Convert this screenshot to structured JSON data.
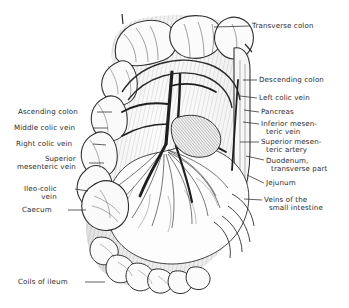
{
  "figure": {
    "style": "pen-and-ink engraving",
    "background_color": "#ffffff",
    "ink_color": "#2b2b2b"
  },
  "labels_right": [
    {
      "id": "transverse-colon",
      "lines": [
        "Transverse colon"
      ],
      "x": 252,
      "y": 22,
      "leader": {
        "x1": 250,
        "y1": 26,
        "x2": 214,
        "y2": 27
      }
    },
    {
      "id": "descending-colon",
      "lines": [
        "Descending colon"
      ],
      "x": 259,
      "y": 76,
      "leader": {
        "x1": 257,
        "y1": 80,
        "x2": 243,
        "y2": 80
      }
    },
    {
      "id": "left-colic-vein",
      "lines": [
        "Left colic vein"
      ],
      "x": 259,
      "y": 94,
      "leader": {
        "x1": 257,
        "y1": 98,
        "x2": 240,
        "y2": 96
      }
    },
    {
      "id": "pancreas",
      "lines": [
        "Pancreas"
      ],
      "x": 261,
      "y": 108,
      "leader": {
        "x1": 259,
        "y1": 112,
        "x2": 244,
        "y2": 110
      }
    },
    {
      "id": "inferior-mesenteric-vein",
      "lines": [
        "Inferior mesen-",
        "teric vein"
      ],
      "x": 261,
      "y": 120,
      "leader": {
        "x1": 259,
        "y1": 124,
        "x2": 243,
        "y2": 122
      }
    },
    {
      "id": "superior-mesenteric-artery",
      "lines": [
        "Superior mesen-",
        "teric artery"
      ],
      "x": 261,
      "y": 138,
      "leader": {
        "x1": 259,
        "y1": 142,
        "x2": 240,
        "y2": 142
      }
    },
    {
      "id": "duodenum-transverse-part",
      "lines": [
        "Duodenum,",
        "transverse part"
      ],
      "x": 266,
      "y": 157,
      "leader": {
        "x1": 264,
        "y1": 160,
        "x2": 246,
        "y2": 156
      }
    },
    {
      "id": "jejunum",
      "lines": [
        "Jejunum"
      ],
      "x": 266,
      "y": 179,
      "leader": {
        "x1": 264,
        "y1": 183,
        "x2": 247,
        "y2": 175
      }
    },
    {
      "id": "veins-of-the-small-intestine",
      "lines": [
        "Veins of the",
        "small intestine"
      ],
      "x": 264,
      "y": 196,
      "leader": {
        "x1": 262,
        "y1": 200,
        "x2": 244,
        "y2": 199
      }
    }
  ],
  "labels_left": [
    {
      "id": "ascending-colon",
      "lines": [
        "Ascending colon"
      ],
      "x": 18,
      "y": 108,
      "leader": {
        "x1": 97,
        "y1": 112,
        "x2": 112,
        "y2": 112
      }
    },
    {
      "id": "middle-colic-vein",
      "lines": [
        "Middle colic vein"
      ],
      "x": 14,
      "y": 124,
      "leader": {
        "x1": 93,
        "y1": 128,
        "x2": 108,
        "y2": 128
      }
    },
    {
      "id": "right-colic-vein",
      "lines": [
        "Right colic vein"
      ],
      "x": 16,
      "y": 140,
      "leader": {
        "x1": 93,
        "y1": 144,
        "x2": 106,
        "y2": 145
      }
    },
    {
      "id": "superior-mesenteric-vein",
      "lines": [
        "Superior",
        "mesenteric vein"
      ],
      "x": 14,
      "y": 155,
      "leader": {
        "x1": 89,
        "y1": 163,
        "x2": 104,
        "y2": 163
      }
    },
    {
      "id": "ileo-colic-vein",
      "lines": [
        "Ileo-colic",
        "vein"
      ],
      "x": 24,
      "y": 185,
      "leader": {
        "x1": 75,
        "y1": 189,
        "x2": 88,
        "y2": 191
      }
    },
    {
      "id": "caecum",
      "lines": [
        "Caecum"
      ],
      "x": 22,
      "y": 206,
      "leader": {
        "x1": 68,
        "y1": 210,
        "x2": 86,
        "y2": 210
      }
    },
    {
      "id": "coils-of-ileum",
      "lines": [
        "Coils of ileum"
      ],
      "x": 18,
      "y": 278,
      "leader": {
        "x1": 85,
        "y1": 282,
        "x2": 105,
        "y2": 282
      }
    }
  ]
}
